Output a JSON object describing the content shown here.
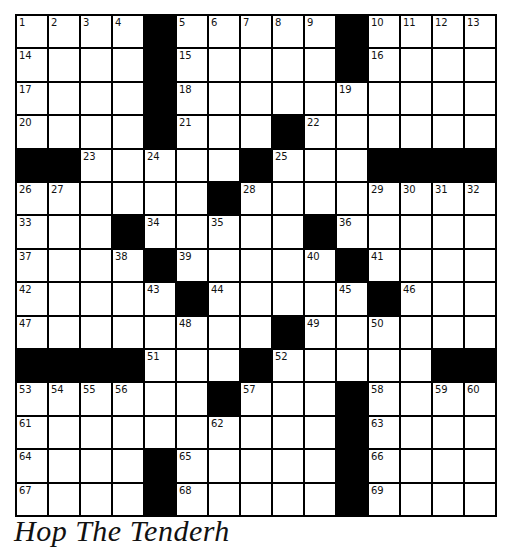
{
  "puzzle": {
    "rows": 15,
    "cols": 15,
    "caption": "Hop The Tenderh",
    "grid": [
      [
        "1",
        "2",
        "3",
        "4",
        "#",
        "5",
        "6",
        "7",
        "8",
        "9",
        "#",
        "10",
        "11",
        "12",
        "13"
      ],
      [
        "14",
        "",
        "",
        "",
        "#",
        "15",
        "",
        "",
        "",
        "",
        "#",
        "16",
        "",
        "",
        ""
      ],
      [
        "17",
        "",
        "",
        "",
        "#",
        "18",
        "",
        "",
        "",
        "",
        "19",
        "",
        "",
        "",
        ""
      ],
      [
        "20",
        "",
        "",
        "",
        "#",
        "21",
        "",
        "",
        "#",
        "22",
        "",
        "",
        "",
        "",
        ""
      ],
      [
        "#",
        "#",
        "23",
        "",
        "24",
        "",
        "",
        "#",
        "25",
        "",
        "",
        "#",
        "#",
        "#",
        "#"
      ],
      [
        "26",
        "27",
        "",
        "",
        "",
        "",
        "#",
        "28",
        "",
        "",
        "",
        "29",
        "30",
        "31",
        "32"
      ],
      [
        "33",
        "",
        "",
        "#",
        "34",
        "",
        "35",
        "",
        "",
        "#",
        "36",
        "",
        "",
        "",
        ""
      ],
      [
        "37",
        "",
        "",
        "38",
        "#",
        "39",
        "",
        "",
        "",
        "40",
        "#",
        "41",
        "",
        "",
        ""
      ],
      [
        "42",
        "",
        "",
        "",
        "43",
        "#",
        "44",
        "",
        "",
        "",
        "45",
        "#",
        "46",
        "",
        ""
      ],
      [
        "47",
        "",
        "",
        "",
        "",
        "48",
        "",
        "",
        "#",
        "49",
        "",
        "50",
        "",
        "",
        ""
      ],
      [
        "#",
        "#",
        "#",
        "#",
        "51",
        "",
        "",
        "#",
        "52",
        "",
        "",
        "",
        "",
        "#",
        "#"
      ],
      [
        "53",
        "54",
        "55",
        "56",
        "",
        "",
        "#",
        "57",
        "",
        "",
        "#",
        "58",
        "",
        "59",
        "60"
      ],
      [
        "61",
        "",
        "",
        "",
        "",
        "",
        "62",
        "",
        "",
        "",
        "#",
        "63",
        "",
        "",
        ""
      ],
      [
        "64",
        "",
        "",
        "",
        "#",
        "65",
        "",
        "",
        "",
        "",
        "#",
        "66",
        "",
        "",
        ""
      ],
      [
        "67",
        "",
        "",
        "",
        "#",
        "68",
        "",
        "",
        "",
        "",
        "#",
        "69",
        "",
        "",
        ""
      ]
    ]
  },
  "colors": {
    "block": "#000000",
    "cell": "#ffffff",
    "text": "#111111"
  }
}
